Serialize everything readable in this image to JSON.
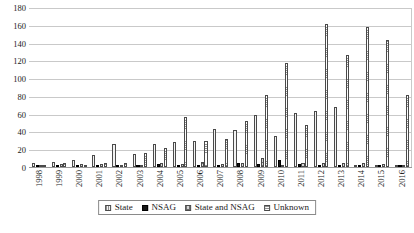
{
  "chart_data": {
    "type": "bar",
    "title": "",
    "subtitle": "",
    "xlabel": "",
    "ylabel": "",
    "ylim": [
      0,
      180
    ],
    "ytick_step": 20,
    "yticks": [
      180,
      160,
      140,
      120,
      100,
      80,
      60,
      40,
      20,
      0
    ],
    "grid": true,
    "legend_position": "bottom",
    "categories": [
      "1998",
      "1999",
      "2000",
      "2001",
      "2002",
      "2003",
      "2004",
      "2005",
      "2006",
      "2007",
      "2008",
      "2009",
      "2010",
      "2011",
      "2012",
      "2013",
      "2014",
      "2015",
      "2016"
    ],
    "series": [
      {
        "name": "State",
        "color": "#f2f2f2",
        "pattern": "fine-grid",
        "values": [
          4,
          6,
          8,
          14,
          26,
          15,
          26,
          28,
          29,
          43,
          42,
          58,
          35,
          61,
          63,
          67,
          0,
          0,
          0
        ]
      },
      {
        "name": "NSAG",
        "color": "#171717",
        "pattern": "solid",
        "values": [
          0,
          0,
          0,
          1,
          0,
          0,
          3,
          0,
          0,
          0,
          5,
          3,
          8,
          3,
          0,
          0,
          0,
          0,
          0
        ]
      },
      {
        "name": "State and NSAG",
        "color": "#d4d4d4",
        "pattern": "coarse-grid",
        "values": [
          1,
          3,
          3,
          3,
          2,
          1,
          4,
          3,
          6,
          3,
          4,
          10,
          2,
          5,
          4,
          5,
          5,
          3,
          2
        ]
      },
      {
        "name": "Unknown",
        "color": "#fdfdfd",
        "pattern": "horizontal-lines",
        "values": [
          2,
          4,
          0,
          4,
          4,
          16,
          21,
          56,
          29,
          31,
          52,
          81,
          117,
          47,
          161,
          126,
          158,
          143,
          81
        ]
      }
    ]
  },
  "legend": {
    "items": [
      {
        "label": "State"
      },
      {
        "label": "NSAG"
      },
      {
        "label": "State and NSAG"
      },
      {
        "label": "Unknown"
      }
    ]
  }
}
